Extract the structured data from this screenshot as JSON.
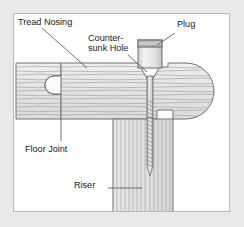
{
  "figure": {
    "kind": "technical-cutaway-diagram",
    "background_color": "#e9e9e9",
    "panel_color": "#ffffff",
    "panel_border_color": "#b9b9b9",
    "wood_fill_color": "#e6e6e6",
    "wood_line_color": "#9a9a9a",
    "outline_color": "#6e6e6e",
    "label_color": "#1b1b1b",
    "leader_color": "#555555"
  },
  "labels": {
    "tread_nosing": "Tread Nosing",
    "countersunk_line1": "Counter-",
    "countersunk_line2": "sunk Hole",
    "plug": "Plug",
    "floor_joint": "Floor Joint",
    "riser": "Riser"
  },
  "parts": [
    {
      "name": "floor-board",
      "label": "Floor Joint",
      "grain": "horizontal-wavy",
      "position": "left",
      "note": "stepped-thickness board meeting tread at tongue-and-groove joint"
    },
    {
      "name": "stair-tread",
      "label": "Tread Nosing",
      "grain": "horizontal-wavy",
      "position": "center-right",
      "note": "rounded bullnose nosing at right end, notched underside at rear"
    },
    {
      "name": "riser",
      "label": "Riser",
      "grain": "vertical-straight",
      "position": "bottom-center",
      "note": "vertical board end grain, receives screw point"
    },
    {
      "name": "countersunk-hole",
      "label": "Counter-sunk Hole",
      "shape": "conical-funnel",
      "note": "cone widening upward above screw head"
    },
    {
      "name": "wood-plug",
      "label": "Plug",
      "shape": "cylinder",
      "note": "cylindrical plug shown lifted above the countersunk hole"
    },
    {
      "name": "screw",
      "shape": "flat-head-wood-screw",
      "note": "smooth shank through tread, threaded portion into riser, tapered point"
    }
  ],
  "annotations": [
    {
      "label": "Tread Nosing",
      "leader": "diagonal-down-right",
      "points_to": "stair-tread-top-surface"
    },
    {
      "label": "Counter-sunk Hole",
      "leader": "diagonal-down-right",
      "points_to": "countersunk-hole"
    },
    {
      "label": "Plug",
      "leader": "diagonal-down-left",
      "points_to": "wood-plug"
    },
    {
      "label": "Floor Joint",
      "leader": "vertical-up",
      "points_to": "tongue-and-groove-joint"
    },
    {
      "label": "Riser",
      "leader": "horizontal-right",
      "points_to": "riser"
    }
  ]
}
